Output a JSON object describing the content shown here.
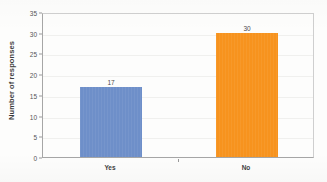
{
  "chart_data": {
    "type": "bar",
    "title": "",
    "subtitle": "",
    "xlabel": "",
    "ylabel": "Number of responses",
    "categories": [
      "Yes",
      "No"
    ],
    "values": [
      17,
      30
    ],
    "data_labels": [
      "17",
      "30"
    ],
    "bar_colors": [
      "#6E8FC9",
      "#F7931E"
    ],
    "ylim": [
      0,
      35
    ],
    "ytick_step": 5,
    "ytick_labels": [
      "0",
      "5",
      "10",
      "15",
      "20",
      "25",
      "30",
      "35"
    ],
    "ytick_values": [
      0,
      5,
      10,
      15,
      20,
      25,
      30,
      35
    ],
    "grid": false,
    "legend": "none",
    "legend_position": "none",
    "plot_border": true,
    "axis_color": "#A6A6A6",
    "background_color": "#FDFDFC"
  }
}
